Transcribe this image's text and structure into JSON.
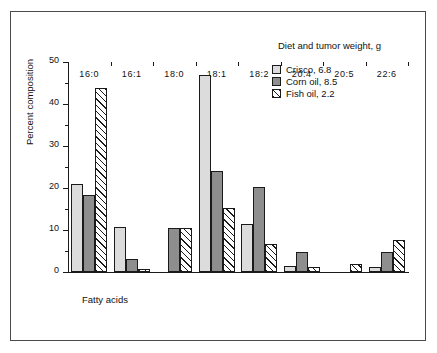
{
  "chart_data": {
    "type": "bar",
    "title": "",
    "xlabel": "Fatty acids",
    "ylabel": "Percent composition",
    "ylim": [
      0,
      50
    ],
    "yticks": [
      0,
      10,
      20,
      30,
      40,
      50
    ],
    "yticks_minor": [
      5,
      15,
      25,
      35,
      45
    ],
    "grid": false,
    "legend_position": "top-right",
    "legend_title": "Diet and tumor weight, g",
    "categories": [
      "16:0",
      "16:1",
      "18:0",
      "18:1",
      "18:2",
      "20:4",
      "20:5",
      "22:6"
    ],
    "series": [
      {
        "name": "Crisco, 6.8",
        "fill": "light-stipple",
        "values": [
          20.9,
          10.7,
          0,
          47.0,
          11.4,
          1.4,
          0,
          1.2
        ]
      },
      {
        "name": "Corn oil, 8.5",
        "fill": "dark-stipple",
        "values": [
          18.3,
          3.2,
          10.4,
          24.0,
          20.2,
          4.8,
          0,
          4.8
        ]
      },
      {
        "name": "Fish oil, 2.2",
        "fill": "diagonal-hatch",
        "values": [
          43.7,
          0.8,
          10.5,
          15.3,
          6.6,
          1.2,
          1.8,
          7.7
        ]
      }
    ]
  },
  "colors": {
    "axis": "#1a1a1a",
    "frame": "#4a4a4a",
    "background": "#ffffff",
    "crisco_fill": "#dcdcdc",
    "corn_fill": "#8e8e8e",
    "fish_fill": "#ffffff"
  }
}
